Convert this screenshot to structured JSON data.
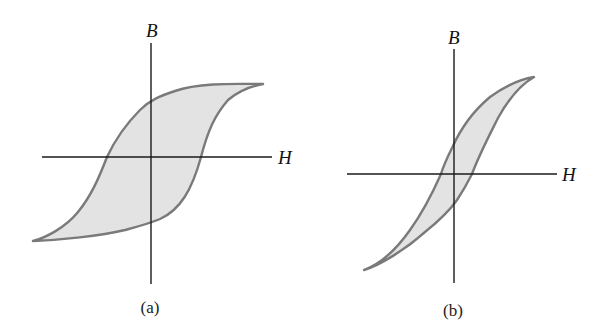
{
  "figure": {
    "panels": [
      {
        "id": "a",
        "caption": "(a)",
        "y_axis_label": "B",
        "x_axis_label": "H",
        "description": "Wide hysteresis loop (hard magnetic material)"
      },
      {
        "id": "b",
        "caption": "(b)",
        "y_axis_label": "B",
        "x_axis_label": "H",
        "description": "Narrow hysteresis loop (soft magnetic material)"
      }
    ],
    "colors": {
      "loop_fill": "#e3e3e3",
      "loop_stroke": "#7a7a7a",
      "axis": "#1a1a1a",
      "text": "#111111"
    }
  }
}
